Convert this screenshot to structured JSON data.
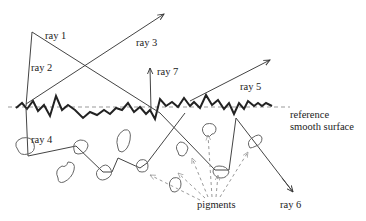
{
  "diagram": {
    "type": "light-scattering-rough-surface",
    "labels": {
      "ray1": "ray 1",
      "ray2": "ray 2",
      "ray3": "ray 3",
      "ray4": "ray 4",
      "ray5": "ray 5",
      "ray6": "ray 6",
      "ray7": "ray 7",
      "reference_line1": "reference",
      "reference_line2": "smooth surface",
      "pigments": "pigments"
    },
    "colors": {
      "line": "#333333",
      "surface": "#222222",
      "dashed": "#999999",
      "pigment": "#666666"
    }
  }
}
